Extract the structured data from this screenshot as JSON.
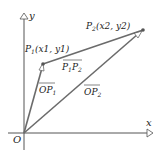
{
  "figure": {
    "axes": {
      "x_label": "x",
      "y_label": "y",
      "origin_label": "O"
    },
    "points": [
      {
        "name": "P1",
        "label_main": "P",
        "label_sub": "1",
        "coords_text": "(x",
        "coords": "(x1, y1)"
      },
      {
        "name": "P2",
        "label_main": "P",
        "label_sub": "2",
        "coords": "(x2, y2)"
      }
    ],
    "vectors": [
      {
        "name": "OP1",
        "label": "OP",
        "sub": "1"
      },
      {
        "name": "OP2",
        "label": "OP",
        "sub": "2"
      },
      {
        "name": "P1P2",
        "label": "P1P2"
      }
    ],
    "colors": {
      "vector": "#6b6b6b",
      "axis": "#555555",
      "text": "#222222"
    }
  }
}
